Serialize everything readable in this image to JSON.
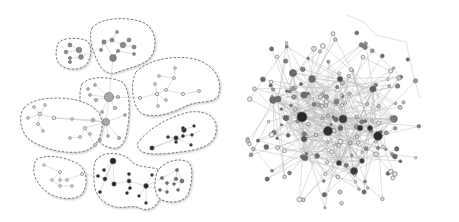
{
  "figure": {
    "panels": [
      {
        "id": "left",
        "description": "clustered network with dashed community hulls",
        "clusters": [
          {
            "name": "cluster-top-left-small",
            "shade": "#8c8c8c"
          },
          {
            "name": "cluster-top-center",
            "shade": "#8c8c8c"
          },
          {
            "name": "cluster-center-hub",
            "shade": "#a6a6a6"
          },
          {
            "name": "cluster-right-upper",
            "shade": "#e0e0e0"
          },
          {
            "name": "cluster-left-middle",
            "shade": "#e0e0e0"
          },
          {
            "name": "cluster-right-lower-dark",
            "shade": "#2a2a2a"
          },
          {
            "name": "cluster-bottom-left",
            "shade": "#ececec"
          },
          {
            "name": "cluster-bottom-center-dark",
            "shade": "#262626"
          },
          {
            "name": "cluster-bottom-right",
            "shade": "#6e6e6e"
          }
        ]
      },
      {
        "id": "right",
        "description": "dense unclustered network hairball"
      }
    ],
    "colors": {
      "hull_stroke": "#7a7a7a",
      "edge": "#c8c8c8",
      "node_light": "#e6e6e6",
      "node_mid": "#8a8a8a",
      "node_dark": "#2b2b2b",
      "background": "#ffffff"
    }
  }
}
